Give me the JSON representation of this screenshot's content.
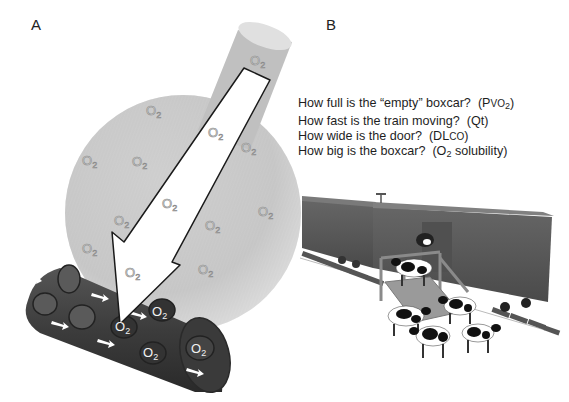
{
  "figure": {
    "panel_a": {
      "label": "A",
      "molecule_label": "O",
      "molecule_subscript": "2",
      "alveolus_o2_count": 14,
      "capillary_o2_count": 4,
      "colors": {
        "alveolus": "#c9c9c9",
        "airway": "#bdbdbd",
        "capillary": "#3d3d3d",
        "rbc": "#555555",
        "arrow_fill": "#ffffff",
        "arrow_stroke": "#1a1a1a"
      }
    },
    "panel_b": {
      "label": "B",
      "questions": [
        {
          "text": "How full is the “empty” boxcar?",
          "param_prefix": "(P",
          "param_small": "VO",
          "param_sub": "2",
          "param_suffix": ")"
        },
        {
          "text": "How fast is the train moving?",
          "param": "(Qt)"
        },
        {
          "text": "How wide is the door?",
          "param_prefix": "(DL",
          "param_small": "CO",
          "param_suffix": ")"
        },
        {
          "text": "How big is the boxcar?",
          "param_prefix": "(O",
          "param_sub": "2",
          "param_suffix": " solubility)"
        }
      ],
      "illustration": "boxcar-train-with-cows-loading-ramp",
      "colors": {
        "boxcar": "#5a5a5a",
        "roof": "#7a7a7a",
        "rails": "#4a4a4a"
      }
    }
  }
}
